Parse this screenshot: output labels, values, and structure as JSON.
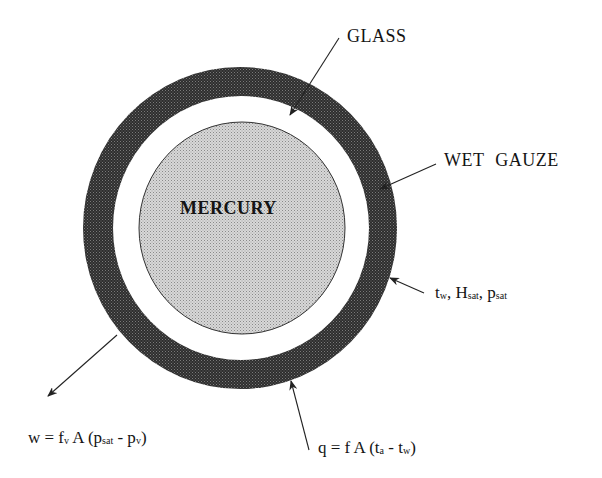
{
  "figure": {
    "type": "wet-bulb thermometer cross-section",
    "colors": {
      "background": "#ffffff",
      "wet_gauze_ring": "#3a3a3a",
      "glass_gap": "#ffffff",
      "mercury_fill": "#c8c8c8",
      "ink": "#141414"
    }
  },
  "regions": {
    "mercury": {
      "label": "MERCURY"
    },
    "glass": {
      "label": "GLASS"
    },
    "wet_gauze": {
      "label": "WET GAUZE"
    }
  },
  "annotations": {
    "surface_state": {
      "parts": [
        {
          "text": "t",
          "sub": "w",
          "sep": ", "
        },
        {
          "text": "H",
          "sub": "sat",
          "sep": ", "
        },
        {
          "text": "p",
          "sub": "sat",
          "sep": ""
        }
      ]
    },
    "mass_flux": {
      "lhs": "w = f",
      "lhs_sub": "v",
      "mid": " A (p",
      "mid_sub": "sat",
      "rest": " - p",
      "rest_sub": "v",
      "close": ")"
    },
    "heat_flux": {
      "lhs": "q = f A (t",
      "lhs_sub": "a",
      "mid": " - t",
      "mid_sub": "w",
      "close": ")"
    }
  }
}
